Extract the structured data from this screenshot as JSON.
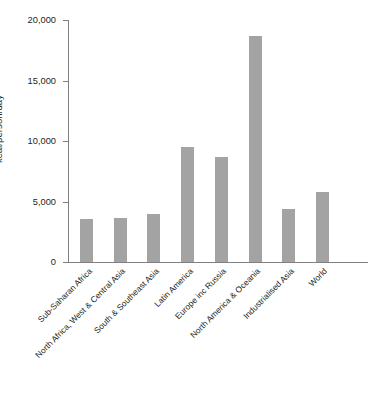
{
  "chart_data": {
    "type": "bar",
    "title": "",
    "xlabel": "",
    "ylabel": "kcal/person/day",
    "ylim": [
      0,
      20000
    ],
    "yticks": [
      0,
      5000,
      10000,
      15000,
      20000
    ],
    "ytick_labels": [
      "0",
      "5,000",
      "10,000",
      "15,000",
      "20,000"
    ],
    "grid": false,
    "legend": false,
    "bar_color": "#a3a3a3",
    "axis_color": "#808080",
    "text_color": "#231f20",
    "categories": [
      "Sub-Saharan Africa",
      "North Africa, West & Central Asia",
      "South & Southeast Asia",
      "Latin America",
      "Europe inc Russia",
      "North America & Oceania",
      "Industrialised Asia",
      "World"
    ],
    "values": [
      3550,
      3650,
      3950,
      9500,
      8650,
      18700,
      4400,
      5800
    ]
  }
}
